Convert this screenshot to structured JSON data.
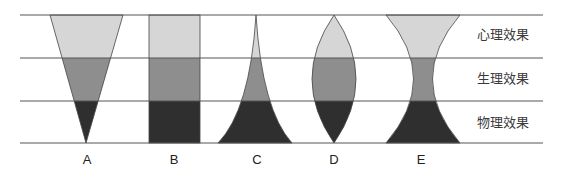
{
  "diagram": {
    "bands": [
      {
        "id": "psychological",
        "label": "心理效果",
        "color": "#d6d6d6"
      },
      {
        "id": "physiological",
        "label": "生理效果",
        "color": "#8e8e8e"
      },
      {
        "id": "physical",
        "label": "物理效果",
        "color": "#2f2f2f"
      }
    ],
    "columns": [
      {
        "id": "A",
        "label": "A",
        "shape": "inverted-funnel"
      },
      {
        "id": "B",
        "label": "B",
        "shape": "rectangle"
      },
      {
        "id": "C",
        "label": "C",
        "shape": "concave-peak"
      },
      {
        "id": "D",
        "label": "D",
        "shape": "lens"
      },
      {
        "id": "E",
        "label": "E",
        "shape": "hourglass"
      }
    ],
    "colors": {
      "line": "#555555",
      "outline": "#444444"
    }
  }
}
